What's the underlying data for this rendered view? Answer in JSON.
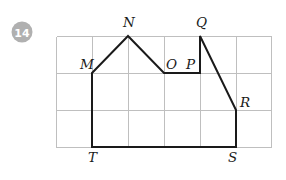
{
  "problem": {
    "number": "14"
  },
  "figure": {
    "name": "polygon-mnopqrst",
    "grid": {
      "cols": 6,
      "rows": 3,
      "origin_x": 56,
      "origin_y": 36,
      "cell_w": 36,
      "cell_h": 37,
      "line_color": "#bfbfbf",
      "visible": true
    },
    "shape": {
      "stroke_color": "#1a1a1a",
      "stroke_width": 2,
      "fill": "none",
      "closed": true,
      "path": "M 92 73 L 128 36 L 164 73 L 200 73 L 200 36 L 236 110 L 236 147 L 92 147 Z"
    },
    "vertices": [
      {
        "id": "M",
        "label": "M",
        "x": 92,
        "y": 73,
        "label_x": 80,
        "label_y": 69
      },
      {
        "id": "N",
        "label": "N",
        "x": 128,
        "y": 36,
        "label_x": 123,
        "label_y": 27
      },
      {
        "id": "O",
        "label": "O",
        "x": 164,
        "y": 73,
        "label_x": 166,
        "label_y": 69
      },
      {
        "id": "P",
        "label": "P",
        "x": 200,
        "y": 73,
        "label_x": 186,
        "label_y": 69
      },
      {
        "id": "Q",
        "label": "Q",
        "x": 200,
        "y": 36,
        "label_x": 196,
        "label_y": 27
      },
      {
        "id": "R",
        "label": "R",
        "x": 236,
        "y": 110,
        "label_x": 240,
        "label_y": 107
      },
      {
        "id": "S",
        "label": "S",
        "x": 236,
        "y": 147,
        "label_x": 228,
        "label_y": 162
      },
      {
        "id": "T",
        "label": "T",
        "x": 92,
        "y": 147,
        "label_x": 88,
        "label_y": 162
      }
    ]
  },
  "colors": {
    "badge_fill": "#b0b0b0",
    "badge_text": "#ffffff",
    "grid_line": "#bfbfbf",
    "shape_stroke": "#1a1a1a",
    "page_background": "#ffffff"
  }
}
